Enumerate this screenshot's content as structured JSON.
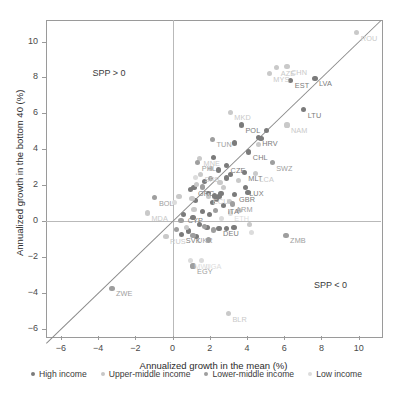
{
  "chart_data": {
    "type": "scatter",
    "title": "",
    "xlabel": "Annualized growth in the mean (%)",
    "ylabel": "Annualized growth in the bottom 40 (%)",
    "xlim": [
      -6.8,
      11.2
    ],
    "ylim": [
      -6.4,
      11.2
    ],
    "xticks": [
      -6,
      -4,
      -2,
      0,
      2,
      4,
      6,
      8,
      10
    ],
    "yticks": [
      -6,
      -4,
      -2,
      0,
      2,
      4,
      6,
      8,
      10
    ],
    "grid": false,
    "legend_position": "bottom",
    "reference_line": {
      "type": "identity",
      "label": "y = x",
      "from": [
        -6.8,
        -6.8
      ],
      "to": [
        11.2,
        11.2
      ]
    },
    "annotations": [
      {
        "text": "SPP > 0",
        "x": -4.3,
        "y": 8.2
      },
      {
        "text": "SPP < 0",
        "x": 7.6,
        "y": -3.6
      }
    ],
    "legend": [
      {
        "label": "High income",
        "color": "#7b7b7b"
      },
      {
        "label": "Upper-middle income",
        "color": "#c7c7c7"
      },
      {
        "label": "Lower-middle income",
        "color": "#9e9e9e"
      },
      {
        "label": "Low income",
        "color": "#dcdcdc"
      }
    ],
    "series": [
      {
        "name": "High income",
        "color": "#7b7b7b",
        "points": [
          {
            "label": "EST",
            "x": 6.35,
            "y": 7.85
          },
          {
            "label": "LVA",
            "x": 7.65,
            "y": 7.95
          },
          {
            "label": "LTU",
            "x": 7.05,
            "y": 6.2
          },
          {
            "label": "POL",
            "x": 3.7,
            "y": 5.35
          },
          {
            "label": "HRV",
            "x": 4.6,
            "y": 4.65
          },
          {
            "label": "CHL",
            "x": 4.1,
            "y": 3.85
          },
          {
            "label": "CZE",
            "x": 2.9,
            "y": 3.1
          },
          {
            "label": "MLT",
            "x": 3.85,
            "y": 2.7
          },
          {
            "label": "LUX",
            "x": 3.9,
            "y": 1.85
          },
          {
            "label": "GBR",
            "x": 3.35,
            "y": 1.5
          },
          {
            "label": "GRC",
            "x": 1.15,
            "y": 1.85
          },
          {
            "label": "CYP",
            "x": 0.6,
            "y": 0.35
          },
          {
            "label": "ITA",
            "x": 2.75,
            "y": 0.85
          },
          {
            "label": "DEU",
            "x": 2.5,
            "y": -0.4
          },
          {
            "label": "SVK",
            "x": 0.5,
            "y": -0.75
          },
          {
            "label": "",
            "x": 5.05,
            "y": 5.05
          },
          {
            "label": "",
            "x": 4.75,
            "y": 4.6
          },
          {
            "label": "",
            "x": 3.35,
            "y": 4.35
          },
          {
            "label": "",
            "x": 2.2,
            "y": 3.55
          },
          {
            "label": "",
            "x": 2.45,
            "y": 2.85
          },
          {
            "label": "",
            "x": 3.1,
            "y": 2.6
          },
          {
            "label": "",
            "x": 2.9,
            "y": 2.4
          },
          {
            "label": "",
            "x": 1.7,
            "y": 2.2
          },
          {
            "label": "",
            "x": 1.25,
            "y": 1.15
          },
          {
            "label": "",
            "x": 1.95,
            "y": 1.55
          },
          {
            "label": "",
            "x": 2.25,
            "y": 1.4
          },
          {
            "label": "",
            "x": 2.5,
            "y": 1.35
          },
          {
            "label": "",
            "x": 2.6,
            "y": 1.55
          },
          {
            "label": "",
            "x": 2.35,
            "y": 1.2
          },
          {
            "label": "",
            "x": 2.15,
            "y": 1.05
          },
          {
            "label": "",
            "x": 1.6,
            "y": 0.55
          },
          {
            "label": "",
            "x": 2.0,
            "y": 0.35
          },
          {
            "label": "",
            "x": 1.1,
            "y": 0.2
          },
          {
            "label": "",
            "x": 1.45,
            "y": -0.2
          },
          {
            "label": "",
            "x": 1.85,
            "y": -0.35
          },
          {
            "label": "",
            "x": 2.9,
            "y": -0.4
          },
          {
            "label": "",
            "x": 3.3,
            "y": -0.35
          },
          {
            "label": "",
            "x": 0.85,
            "y": -0.55
          },
          {
            "label": "",
            "x": 1.3,
            "y": -0.85
          },
          {
            "label": "",
            "x": 0.95,
            "y": 1.75
          },
          {
            "label": "",
            "x": 4.05,
            "y": 1.6
          }
        ]
      },
      {
        "name": "Upper-middle income",
        "color": "#c9c9c9",
        "points": [
          {
            "label": "MYS",
            "x": 5.2,
            "y": 8.2
          },
          {
            "label": "MKD",
            "x": 3.1,
            "y": 6.05
          },
          {
            "label": "MNE",
            "x": 1.45,
            "y": 3.5
          },
          {
            "label": "SRB",
            "x": 1.5,
            "y": 2.6
          },
          {
            "label": "ECU",
            "x": 1.95,
            "y": 1.4
          },
          {
            "label": "LCA",
            "x": 4.45,
            "y": 2.65
          },
          {
            "label": "NAM",
            "x": 6.15,
            "y": 5.35
          },
          {
            "label": "CHN",
            "x": 6.15,
            "y": 8.6
          },
          {
            "label": "AZE",
            "x": 5.6,
            "y": 8.55
          },
          {
            "label": "ROU",
            "x": 9.9,
            "y": 10.5
          },
          {
            "label": "MDA",
            "x": -1.35,
            "y": 0.45
          },
          {
            "label": "RUS",
            "x": -0.35,
            "y": -0.85
          },
          {
            "label": "BLR",
            "x": 3.0,
            "y": -5.15
          },
          {
            "label": "",
            "x": 2.05,
            "y": 2.95
          },
          {
            "label": "",
            "x": 2.55,
            "y": 2.15
          },
          {
            "label": "",
            "x": 1.3,
            "y": 2.05
          },
          {
            "label": "",
            "x": 1.05,
            "y": 1.25
          },
          {
            "label": "",
            "x": 2.75,
            "y": 1.85
          },
          {
            "label": "",
            "x": 3.05,
            "y": 1.1
          },
          {
            "label": "",
            "x": 3.6,
            "y": 0.6
          },
          {
            "label": "",
            "x": 4.15,
            "y": -0.2
          },
          {
            "label": "",
            "x": 0.75,
            "y": -0.35
          },
          {
            "label": "",
            "x": 1.15,
            "y": 0.65
          },
          {
            "label": "",
            "x": 0.35,
            "y": 1.35
          },
          {
            "label": "",
            "x": 3.55,
            "y": 2.25
          },
          {
            "label": "",
            "x": 4.6,
            "y": 4.25
          }
        ]
      },
      {
        "name": "Lower-middle income",
        "color": "#9e9e9e",
        "points": [
          {
            "label": "TUN",
            "x": 2.15,
            "y": 4.55
          },
          {
            "label": "PHL",
            "x": 1.35,
            "y": 3.25
          },
          {
            "label": "BOL",
            "x": -0.95,
            "y": 1.3
          },
          {
            "label": "UKR",
            "x": 1.1,
            "y": -0.8
          },
          {
            "label": "ZMB",
            "x": 6.1,
            "y": -0.8
          },
          {
            "label": "EGY",
            "x": 1.1,
            "y": -2.5
          },
          {
            "label": "ZWE",
            "x": -3.25,
            "y": -3.75
          },
          {
            "label": "SWZ",
            "x": 5.35,
            "y": 3.25
          },
          {
            "label": "ARM",
            "x": 3.2,
            "y": 0.95
          },
          {
            "label": "",
            "x": 2.05,
            "y": 2.35
          },
          {
            "label": "",
            "x": 1.6,
            "y": 1.9
          },
          {
            "label": "",
            "x": 2.3,
            "y": 0.6
          },
          {
            "label": "",
            "x": 0.45,
            "y": 0.05
          },
          {
            "label": "",
            "x": 1.7,
            "y": -0.3
          },
          {
            "label": "",
            "x": 2.2,
            "y": -0.5
          },
          {
            "label": "",
            "x": 0.2,
            "y": -0.45
          },
          {
            "label": "",
            "x": 1.95,
            "y": -1.05
          }
        ]
      },
      {
        "name": "Low income",
        "color": "#dcdcdc",
        "points": [
          {
            "label": "ETH",
            "x": 3.1,
            "y": 0.45
          },
          {
            "label": "UGA",
            "x": 1.55,
            "y": -2.2
          },
          {
            "label": "MWI",
            "x": 0.95,
            "y": -2.2
          },
          {
            "label": "",
            "x": 4.25,
            "y": -0.65
          },
          {
            "label": "",
            "x": 0.1,
            "y": 1.05
          },
          {
            "label": "",
            "x": 2.65,
            "y": 0.15
          },
          {
            "label": "",
            "x": 1.25,
            "y": 2.45
          }
        ]
      }
    ]
  }
}
